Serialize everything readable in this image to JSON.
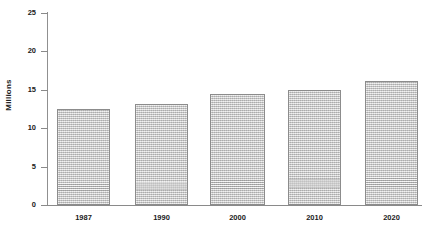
{
  "chart_data": {
    "type": "bar",
    "title": "",
    "xlabel": "",
    "ylabel": "Millions",
    "categories": [
      "1987",
      "1990",
      "2000",
      "2010",
      "2020"
    ],
    "values": [
      12.5,
      13.2,
      14.5,
      15.0,
      16.1
    ],
    "ylim": [
      0,
      25
    ],
    "yticks": [
      0,
      5,
      10,
      15,
      20,
      25
    ],
    "ytick_labels": [
      "0",
      "5",
      "10",
      "15",
      "20",
      "25"
    ],
    "grid": false,
    "legend": null,
    "series": [
      {
        "name": "",
        "values": [
          12.5,
          13.2,
          14.5,
          15.0,
          16.1
        ]
      }
    ],
    "colors": {
      "bar_fill": "#c9c9c9",
      "bar_border": "#8c8c8c",
      "axis": "#8a8a8a",
      "text": "#1a1a1a",
      "background": "#ffffff"
    }
  },
  "axis": {
    "y_title": "Millions",
    "y_ticks": [
      "0",
      "5",
      "10",
      "15",
      "20",
      "25"
    ],
    "x_ticks": [
      "1987",
      "1990",
      "2000",
      "2010",
      "2020"
    ]
  }
}
